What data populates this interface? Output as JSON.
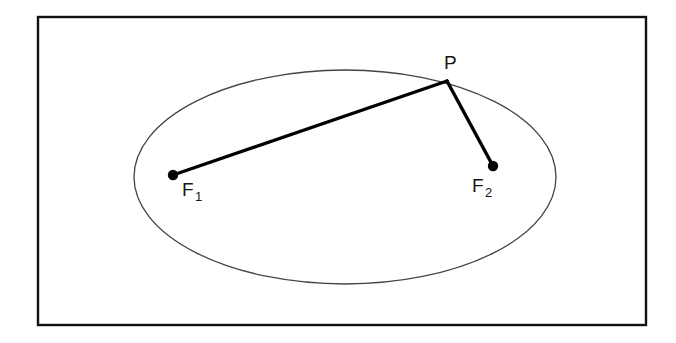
{
  "figure": {
    "background_color": "#ffffff",
    "frame": {
      "name": "outer-rectangle-border",
      "x": 38,
      "y": 17,
      "width": 608,
      "height": 308,
      "stroke_color": "#111111",
      "stroke_width": 2.4,
      "fill": "none"
    },
    "ellipse": {
      "name": "ellipse-curve",
      "cx": 345,
      "cy": 177,
      "rx": 211,
      "ry": 107,
      "stroke_color": "#444444",
      "stroke_width": 1.3,
      "fill": "none"
    },
    "points": [
      {
        "id": "F1",
        "role": "focus",
        "label": "F",
        "subscript": "1",
        "cx": 173,
        "cy": 175,
        "radius": 5.2,
        "color": "#000000",
        "label_x": 182,
        "label_y": 196,
        "sub_x": 195,
        "sub_y": 201
      },
      {
        "id": "F2",
        "role": "focus",
        "label": "F",
        "subscript": "2",
        "cx": 493,
        "cy": 166,
        "radius": 5.2,
        "color": "#000000",
        "label_x": 472,
        "label_y": 192,
        "sub_x": 485,
        "sub_y": 197
      },
      {
        "id": "P",
        "role": "point-on-ellipse",
        "label": "P",
        "subscript": "",
        "cx": 447,
        "cy": 81,
        "radius": 0,
        "color": "#000000",
        "label_x": 444,
        "label_y": 69,
        "sub_x": 0,
        "sub_y": 0
      }
    ],
    "segments": [
      {
        "name": "segment-f1-to-p",
        "from": "F1",
        "to": "P",
        "x1": 173,
        "y1": 175,
        "x2": 447,
        "y2": 81,
        "stroke_color": "#000000",
        "stroke_width": 3.4
      },
      {
        "name": "segment-p-to-f2",
        "from": "P",
        "to": "F2",
        "x1": 447,
        "y1": 81,
        "x2": 493,
        "y2": 166,
        "stroke_color": "#000000",
        "stroke_width": 3.4
      }
    ]
  },
  "chart_data": {
    "type": "scatter",
    "xlabel": "",
    "ylabel": "",
    "xlim": [
      0,
      676
    ],
    "ylim": [
      343,
      0
    ],
    "grid": false,
    "legend": null,
    "annotations": [
      "P",
      "F1",
      "F2"
    ],
    "shapes": [
      {
        "kind": "rectangle",
        "x": 38,
        "y": 17,
        "width": 608,
        "height": 308
      },
      {
        "kind": "ellipse",
        "cx": 345,
        "cy": 177,
        "rx": 211,
        "ry": 107
      },
      {
        "kind": "line",
        "points": [
          [
            173,
            175
          ],
          [
            447,
            81
          ]
        ]
      },
      {
        "kind": "line",
        "points": [
          [
            447,
            81
          ],
          [
            493,
            166
          ]
        ]
      }
    ],
    "x": [
      173,
      493,
      447
    ],
    "y": [
      175,
      166,
      81
    ],
    "point_labels": [
      "F1",
      "F2",
      "P"
    ]
  }
}
